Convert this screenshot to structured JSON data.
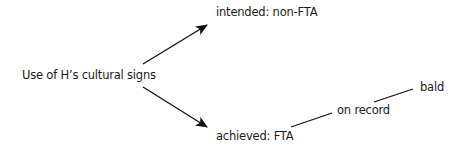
{
  "diagram": {
    "root": "Use of H’s cultural signs",
    "branches": {
      "intended": "intended: non-FTA",
      "achieved": "achieved: FTA"
    },
    "sub_branches": {
      "on_record": "on record",
      "bald": "bald"
    }
  }
}
